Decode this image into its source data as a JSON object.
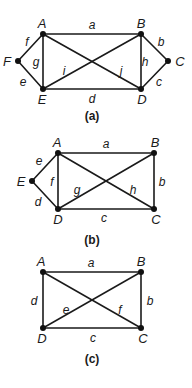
{
  "figures": [
    {
      "id": "a",
      "caption": "(a)",
      "caption_pos": [
        92,
        120
      ],
      "vertices": [
        {
          "name": "A",
          "x": 43,
          "y": 34,
          "lx": 42,
          "ly": 28
        },
        {
          "name": "B",
          "x": 141,
          "y": 34,
          "lx": 141,
          "ly": 28
        },
        {
          "name": "C",
          "x": 168,
          "y": 61,
          "lx": 180,
          "ly": 66
        },
        {
          "name": "D",
          "x": 141,
          "y": 89,
          "lx": 142,
          "ly": 104
        },
        {
          "name": "E",
          "x": 43,
          "y": 89,
          "lx": 42,
          "ly": 104
        },
        {
          "name": "F",
          "x": 18,
          "y": 61,
          "lx": 7,
          "ly": 66
        }
      ],
      "edges": [
        {
          "label": "a",
          "from": "A",
          "to": "B",
          "lx": 92,
          "ly": 29
        },
        {
          "label": "b",
          "from": "B",
          "to": "C",
          "lx": 161,
          "ly": 46
        },
        {
          "label": "c",
          "from": "C",
          "to": "D",
          "lx": 159,
          "ly": 86
        },
        {
          "label": "d",
          "from": "E",
          "to": "D",
          "lx": 92,
          "ly": 103
        },
        {
          "label": "e",
          "from": "F",
          "to": "E",
          "lx": 23,
          "ly": 86
        },
        {
          "label": "f",
          "from": "F",
          "to": "A",
          "lx": 27,
          "ly": 46
        },
        {
          "label": "g",
          "from": "A",
          "to": "E",
          "lx": 36,
          "ly": 66
        },
        {
          "label": "h",
          "from": "B",
          "to": "D",
          "lx": 145,
          "ly": 66
        },
        {
          "label": "i",
          "from": "E",
          "to": "B",
          "lx": 64,
          "ly": 75
        },
        {
          "label": "j",
          "from": "A",
          "to": "D",
          "lx": 121,
          "ly": 75
        }
      ]
    },
    {
      "id": "b",
      "caption": "(b)",
      "caption_pos": [
        92,
        244
      ],
      "vertices": [
        {
          "name": "A",
          "x": 58,
          "y": 153,
          "lx": 57,
          "ly": 147
        },
        {
          "name": "B",
          "x": 154,
          "y": 153,
          "lx": 155,
          "ly": 147
        },
        {
          "name": "C",
          "x": 154,
          "y": 209,
          "lx": 156,
          "ly": 224
        },
        {
          "name": "D",
          "x": 58,
          "y": 209,
          "lx": 58,
          "ly": 224
        },
        {
          "name": "E",
          "x": 32,
          "y": 181,
          "lx": 21,
          "ly": 186
        }
      ],
      "edges": [
        {
          "label": "a",
          "from": "A",
          "to": "B",
          "lx": 106,
          "ly": 148
        },
        {
          "label": "b",
          "from": "B",
          "to": "C",
          "lx": 162,
          "ly": 186
        },
        {
          "label": "c",
          "from": "D",
          "to": "C",
          "lx": 104,
          "ly": 222
        },
        {
          "label": "d",
          "from": "E",
          "to": "D",
          "lx": 38,
          "ly": 206
        },
        {
          "label": "e",
          "from": "E",
          "to": "A",
          "lx": 39,
          "ly": 165
        },
        {
          "label": "f",
          "from": "A",
          "to": "D",
          "lx": 52,
          "ly": 186
        },
        {
          "label": "g",
          "from": "D",
          "to": "B",
          "lx": 77,
          "ly": 194
        },
        {
          "label": "h",
          "from": "A",
          "to": "C",
          "lx": 133,
          "ly": 194
        }
      ]
    },
    {
      "id": "c",
      "caption": "(c)",
      "caption_pos": [
        92,
        363
      ],
      "vertices": [
        {
          "name": "A",
          "x": 43,
          "y": 272,
          "lx": 41,
          "ly": 266
        },
        {
          "name": "B",
          "x": 141,
          "y": 272,
          "lx": 141,
          "ly": 266
        },
        {
          "name": "C",
          "x": 141,
          "y": 328,
          "lx": 143,
          "ly": 343
        },
        {
          "name": "D",
          "x": 43,
          "y": 328,
          "lx": 42,
          "ly": 343
        }
      ],
      "edges": [
        {
          "label": "a",
          "from": "A",
          "to": "B",
          "lx": 91,
          "ly": 267
        },
        {
          "label": "b",
          "from": "B",
          "to": "C",
          "lx": 150,
          "ly": 305
        },
        {
          "label": "c",
          "from": "D",
          "to": "C",
          "lx": 93,
          "ly": 342
        },
        {
          "label": "d",
          "from": "A",
          "to": "D",
          "lx": 34,
          "ly": 305
        },
        {
          "label": "e",
          "from": "D",
          "to": "B",
          "lx": 66,
          "ly": 314
        },
        {
          "label": "f",
          "from": "A",
          "to": "C",
          "lx": 120,
          "ly": 314
        }
      ]
    }
  ]
}
